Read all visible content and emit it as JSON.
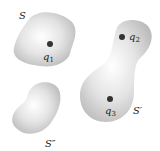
{
  "figure": {
    "surfaces": [
      {
        "id": "S",
        "label": "S"
      },
      {
        "id": "S_prime",
        "label": "S′"
      },
      {
        "id": "S_double_prime",
        "label": "S″"
      }
    ],
    "charges": [
      {
        "id": "q1",
        "symbol": "q",
        "subscript": "1"
      },
      {
        "id": "q2",
        "symbol": "q",
        "subscript": "2"
      },
      {
        "id": "q3",
        "symbol": "q",
        "subscript": "3"
      }
    ]
  }
}
